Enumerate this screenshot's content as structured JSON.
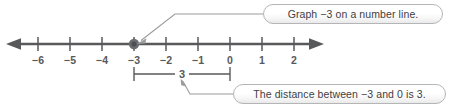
{
  "figure": {
    "line_color": "#58595b",
    "point_color": "#6b6c70",
    "text_color": "#3f4042",
    "callout_border_color": "#b4b5b7"
  },
  "number_line": {
    "min": -6,
    "max": 2,
    "ticks": [
      -6,
      -5,
      -4,
      -3,
      -2,
      -1,
      0,
      1,
      2
    ],
    "tick_labels": [
      "−6",
      "−5",
      "−4",
      "−3",
      "−2",
      "−1",
      "0",
      "1",
      "2"
    ],
    "left_arrow": true,
    "right_arrow": true,
    "plotted_point": {
      "value": -3,
      "label": "−3",
      "marker": "filled-dot"
    }
  },
  "measure": {
    "from": -3,
    "to": 0,
    "label": "3"
  },
  "callouts": [
    {
      "id": "graph",
      "text": "Graph −3 on a number line.",
      "points_to": "plotted-point"
    },
    {
      "id": "distance",
      "text": "The distance between −3 and 0 is 3.",
      "points_to": "measure-bracket"
    }
  ],
  "icons": {
    "arrow_left": "arrow-left-icon",
    "arrow_right": "arrow-right-icon",
    "pointer": "leader-arrow-icon"
  }
}
